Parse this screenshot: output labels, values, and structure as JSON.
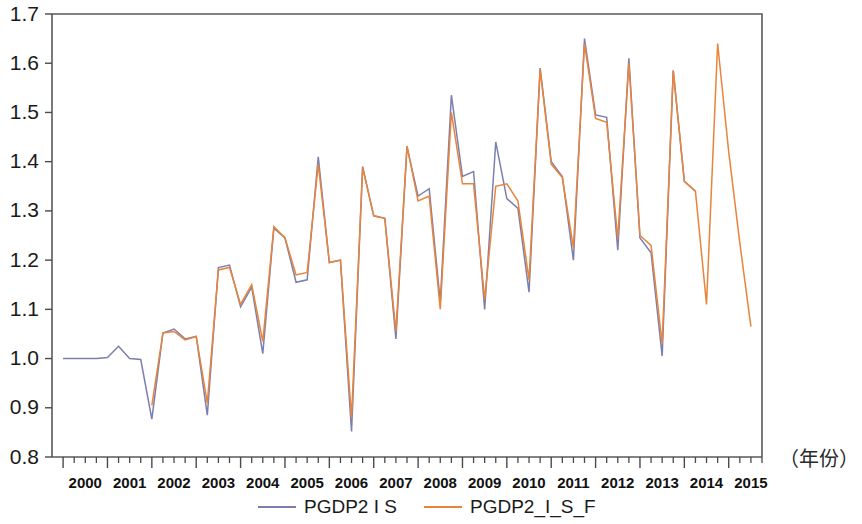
{
  "chart_data": {
    "type": "line",
    "title": "",
    "subtitle": "",
    "xlabel": "（年份）",
    "ylabel": "",
    "ylim": [
      0.8,
      1.7
    ],
    "ytick_labels": [
      "1.7",
      "1.6",
      "1.5",
      "1.4",
      "1.3",
      "1.2",
      "1.1",
      "1.0",
      "0.9",
      "0.8"
    ],
    "ytick_values": [
      1.7,
      1.6,
      1.5,
      1.4,
      1.3,
      1.2,
      1.1,
      1.0,
      0.9,
      0.8
    ],
    "grid": false,
    "legend_position": "bottom",
    "xlim": [
      1999.75,
      2015.75
    ],
    "x_tick_labels": [
      "2000",
      "2001",
      "2002",
      "2003",
      "2004",
      "2005",
      "2006",
      "2007",
      "2008",
      "2009",
      "2010",
      "2011",
      "2012",
      "2013",
      "2014",
      "2015"
    ],
    "x_minor_ticks_per_year": 4,
    "x": [
      2000.0,
      2000.25,
      2000.5,
      2000.75,
      2001.0,
      2001.25,
      2001.5,
      2001.75,
      2002.0,
      2002.25,
      2002.5,
      2002.75,
      2003.0,
      2003.25,
      2003.5,
      2003.75,
      2004.0,
      2004.25,
      2004.5,
      2004.75,
      2005.0,
      2005.25,
      2005.5,
      2005.75,
      2006.0,
      2006.25,
      2006.5,
      2006.75,
      2007.0,
      2007.25,
      2007.5,
      2007.75,
      2008.0,
      2008.25,
      2008.5,
      2008.75,
      2009.0,
      2009.25,
      2009.5,
      2009.75,
      2010.0,
      2010.25,
      2010.5,
      2010.75,
      2011.0,
      2011.25,
      2011.5,
      2011.75,
      2012.0,
      2012.25,
      2012.5,
      2012.75,
      2013.0,
      2013.25,
      2013.5,
      2013.75,
      2014.0,
      2014.25,
      2014.5,
      2014.75,
      2015.0,
      2015.25,
      2015.5
    ],
    "series": [
      {
        "name": "PGDP2 I S",
        "color": "#7b7fae",
        "values": [
          1.0,
          1.0,
          1.0,
          1.0,
          1.002,
          1.025,
          1.0,
          0.998,
          0.877,
          1.052,
          1.06,
          1.04,
          1.045,
          0.885,
          1.185,
          1.19,
          1.105,
          1.145,
          1.01,
          1.265,
          1.245,
          1.155,
          1.16,
          1.41,
          1.195,
          1.2,
          0.852,
          1.39,
          1.29,
          1.285,
          1.04,
          1.43,
          1.33,
          1.345,
          1.115,
          1.535,
          1.37,
          1.38,
          1.1,
          1.44,
          1.325,
          1.305,
          1.135,
          1.59,
          1.4,
          1.37,
          1.2,
          1.65,
          1.495,
          1.49,
          1.22,
          1.61,
          1.245,
          1.215,
          1.005,
          1.585,
          1.36,
          1.34,
          null,
          null,
          null,
          null,
          null
        ],
        "last_observed_x": 2014.25
      },
      {
        "name": "PGDP2_I_S_F",
        "color": "#e8843c",
        "values": [
          null,
          null,
          null,
          null,
          null,
          null,
          null,
          null,
          0.905,
          1.052,
          1.055,
          1.038,
          1.045,
          0.91,
          1.18,
          1.185,
          1.11,
          1.15,
          1.035,
          1.268,
          1.245,
          1.17,
          1.175,
          1.395,
          1.195,
          1.2,
          0.88,
          1.388,
          1.29,
          1.285,
          1.055,
          1.432,
          1.32,
          1.33,
          1.1,
          1.5,
          1.355,
          1.355,
          1.12,
          1.35,
          1.355,
          1.32,
          1.16,
          1.588,
          1.395,
          1.368,
          1.225,
          1.64,
          1.488,
          1.48,
          1.245,
          1.6,
          1.25,
          1.23,
          1.03,
          1.585,
          1.36,
          1.34,
          1.11,
          1.64,
          1.42,
          1.235,
          1.065
        ],
        "last_observed_x": 2015.5
      }
    ]
  },
  "legend": {
    "items": [
      {
        "label": "PGDP2 I S",
        "color": "#7b7fae"
      },
      {
        "label": "PGDP2_I_S_F",
        "color": "#e8843c"
      }
    ]
  },
  "axis": {
    "x_caption": "（年份）"
  }
}
